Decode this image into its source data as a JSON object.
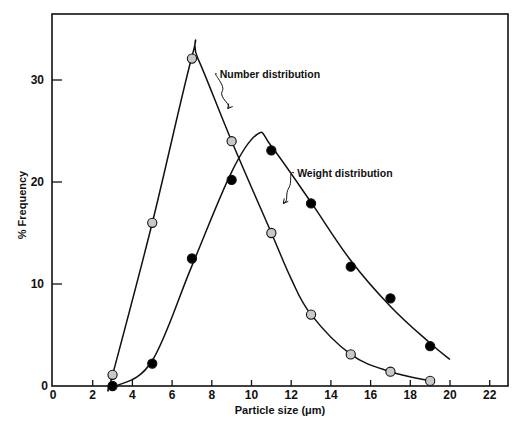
{
  "chart_data": {
    "type": "line",
    "title": "",
    "xlabel": "Particle size (μm)",
    "ylabel": "% Frequency",
    "xlim": [
      0,
      23
    ],
    "ylim": [
      0,
      36
    ],
    "xticks": [
      0,
      2,
      4,
      6,
      8,
      10,
      12,
      14,
      16,
      18,
      20,
      22
    ],
    "yticks": [
      0,
      10,
      20,
      30
    ],
    "grid": false,
    "legend": "inline annotations",
    "series": [
      {
        "name": "Number distribution",
        "marker": "gray-circle",
        "color": "#c8c8c8",
        "points": [
          [
            3,
            1.1
          ],
          [
            5,
            16
          ],
          [
            7,
            32.1
          ],
          [
            9,
            24
          ],
          [
            11,
            15
          ],
          [
            13,
            7
          ],
          [
            15,
            3.1
          ],
          [
            17,
            1.4
          ],
          [
            19,
            0.5
          ]
        ],
        "curve": [
          [
            2.8,
            0
          ],
          [
            3,
            1.1
          ],
          [
            5,
            16
          ],
          [
            7,
            32.3
          ],
          [
            7.3,
            32.1
          ],
          [
            9,
            24
          ],
          [
            11,
            15
          ],
          [
            12,
            10.5
          ],
          [
            13,
            7
          ],
          [
            15,
            3.1
          ],
          [
            17,
            1.4
          ],
          [
            19,
            0.5
          ]
        ]
      },
      {
        "name": "Weight distribution",
        "marker": "black-circle",
        "color": "#000000",
        "points": [
          [
            3,
            0
          ],
          [
            5,
            2.2
          ],
          [
            7,
            12.5
          ],
          [
            9,
            20.2
          ],
          [
            11,
            23.1
          ],
          [
            13,
            17.9
          ],
          [
            15,
            11.7
          ],
          [
            17,
            8.6
          ],
          [
            19,
            3.9
          ]
        ],
        "curve": [
          [
            2.8,
            0
          ],
          [
            3.2,
            0
          ],
          [
            5,
            2.5
          ],
          [
            7,
            11.8
          ],
          [
            9,
            21
          ],
          [
            10.3,
            24.7
          ],
          [
            11,
            23.5
          ],
          [
            13,
            18
          ],
          [
            15,
            12.3
          ],
          [
            17,
            7.8
          ],
          [
            19,
            4.2
          ],
          [
            20,
            2.6
          ]
        ]
      }
    ],
    "annotations": [
      {
        "text": "Number distribution",
        "x": 8.4,
        "y": 30.2,
        "points_to": [
          8.8,
          27.2
        ]
      },
      {
        "text": "Weight distribution",
        "x": 12.3,
        "y": 20.5,
        "points_to": [
          11.6,
          17.9
        ]
      }
    ]
  }
}
